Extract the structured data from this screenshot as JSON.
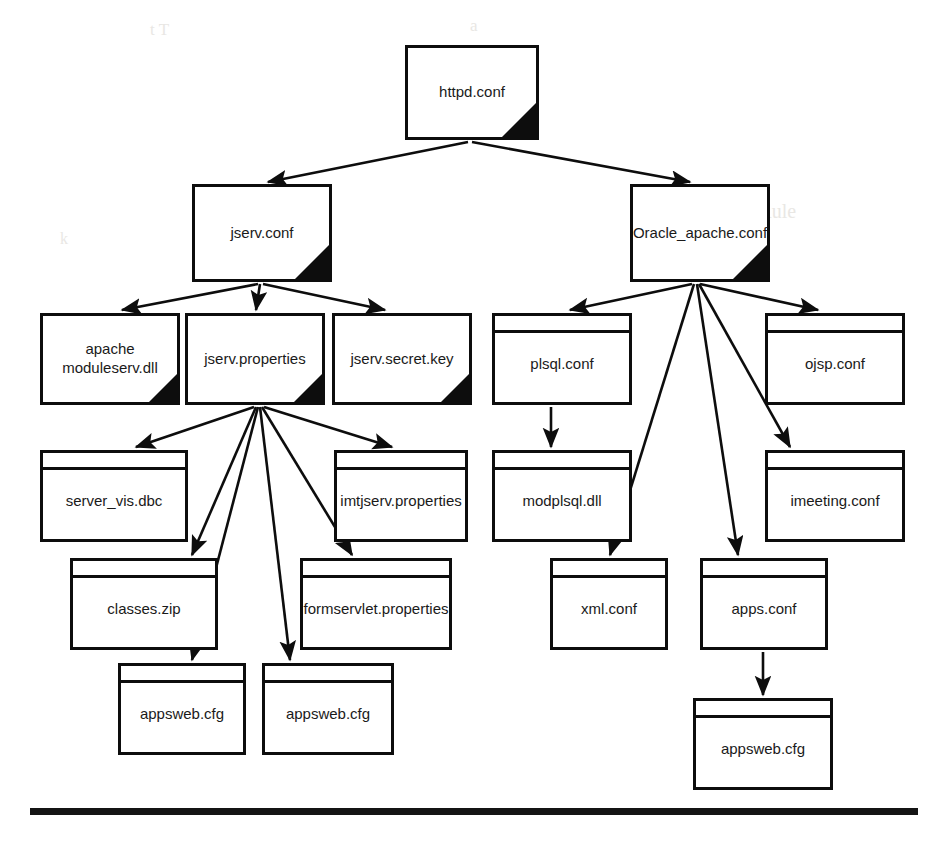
{
  "figure": {
    "type": "tree-diagram",
    "style": {
      "line_color": "#0d0d0d",
      "box_fill": "#ffffff",
      "page_background": "#ffffff"
    }
  },
  "nodes": [
    {
      "id": "httpd",
      "label": "httpd.conf",
      "shape": "dogear",
      "x": 405,
      "y": 45,
      "w": 134,
      "h": 95
    },
    {
      "id": "jserv",
      "label": "jserv.conf",
      "shape": "dogear",
      "x": 192,
      "y": 184,
      "w": 140,
      "h": 98
    },
    {
      "id": "oracle",
      "label": "Oracle_apache.conf",
      "shape": "dogear",
      "x": 630,
      "y": 184,
      "w": 140,
      "h": 98
    },
    {
      "id": "apachemod",
      "label": "apache\nmoduleserv.dll",
      "shape": "dogear",
      "x": 40,
      "y": 313,
      "w": 140,
      "h": 92
    },
    {
      "id": "jservprops",
      "label": "jserv.properties",
      "shape": "dogear",
      "x": 185,
      "y": 313,
      "w": 140,
      "h": 92
    },
    {
      "id": "jservsecret",
      "label": "jserv.secret.key",
      "shape": "dogear",
      "x": 332,
      "y": 313,
      "w": 140,
      "h": 92
    },
    {
      "id": "plsql",
      "label": "plsql.conf",
      "shape": "banded",
      "x": 492,
      "y": 313,
      "w": 140,
      "h": 92
    },
    {
      "id": "ojsp",
      "label": "ojsp.conf",
      "shape": "banded",
      "x": 765,
      "y": 313,
      "w": 140,
      "h": 92
    },
    {
      "id": "servervis",
      "label": "server_vis.dbc",
      "shape": "banded",
      "x": 40,
      "y": 450,
      "w": 148,
      "h": 92
    },
    {
      "id": "imtjserv",
      "label": "imtjserv.properties",
      "shape": "banded",
      "x": 334,
      "y": 450,
      "w": 134,
      "h": 92
    },
    {
      "id": "modplsql",
      "label": "modplsql.dll",
      "shape": "banded",
      "x": 492,
      "y": 450,
      "w": 140,
      "h": 92
    },
    {
      "id": "imeeting",
      "label": "imeeting.conf",
      "shape": "banded",
      "x": 765,
      "y": 450,
      "w": 140,
      "h": 92
    },
    {
      "id": "classeszip",
      "label": "classes.zip",
      "shape": "banded",
      "x": 70,
      "y": 558,
      "w": 148,
      "h": 92
    },
    {
      "id": "formservlet",
      "label": "formservlet.properties",
      "shape": "banded",
      "x": 300,
      "y": 558,
      "w": 152,
      "h": 92
    },
    {
      "id": "xmlconf",
      "label": "xml.conf",
      "shape": "banded",
      "x": 550,
      "y": 558,
      "w": 118,
      "h": 92
    },
    {
      "id": "appsconf",
      "label": "apps.conf",
      "shape": "banded",
      "x": 700,
      "y": 558,
      "w": 128,
      "h": 92
    },
    {
      "id": "appsweb1",
      "label": "appsweb.cfg",
      "shape": "banded",
      "x": 118,
      "y": 663,
      "w": 128,
      "h": 92
    },
    {
      "id": "appsweb2",
      "label": "appsweb.cfg",
      "shape": "banded",
      "x": 262,
      "y": 663,
      "w": 132,
      "h": 92
    },
    {
      "id": "appsweb3",
      "label": "appsweb.cfg",
      "shape": "banded",
      "x": 693,
      "y": 698,
      "w": 140,
      "h": 92
    }
  ],
  "edges": [
    {
      "from": "httpd",
      "to": "jserv",
      "x1": 468,
      "y1": 142,
      "x2": 268,
      "y2": 182
    },
    {
      "from": "httpd",
      "to": "oracle",
      "x1": 472,
      "y1": 142,
      "x2": 690,
      "y2": 182
    },
    {
      "from": "jserv",
      "to": "apachemod",
      "x1": 258,
      "y1": 284,
      "x2": 122,
      "y2": 310
    },
    {
      "from": "jserv",
      "to": "jservprops",
      "x1": 260,
      "y1": 284,
      "x2": 256,
      "y2": 310
    },
    {
      "from": "jserv",
      "to": "jservsecret",
      "x1": 263,
      "y1": 284,
      "x2": 385,
      "y2": 310
    },
    {
      "from": "oracle",
      "to": "plsql",
      "x1": 692,
      "y1": 284,
      "x2": 570,
      "y2": 310
    },
    {
      "from": "oracle",
      "to": "xmlconf",
      "x1": 694,
      "y1": 284,
      "x2": 610,
      "y2": 555
    },
    {
      "from": "oracle",
      "to": "appsconf",
      "x1": 697,
      "y1": 284,
      "x2": 738,
      "y2": 555
    },
    {
      "from": "oracle",
      "to": "imeeting",
      "x1": 699,
      "y1": 284,
      "x2": 790,
      "y2": 447
    },
    {
      "from": "oracle",
      "to": "ojsp",
      "x1": 700,
      "y1": 284,
      "x2": 818,
      "y2": 310
    },
    {
      "from": "jservprops",
      "to": "servervis",
      "x1": 254,
      "y1": 407,
      "x2": 136,
      "y2": 447
    },
    {
      "from": "jservprops",
      "to": "classeszip",
      "x1": 256,
      "y1": 407,
      "x2": 192,
      "y2": 555
    },
    {
      "from": "jservprops",
      "to": "appsweb1",
      "x1": 258,
      "y1": 407,
      "x2": 192,
      "y2": 660
    },
    {
      "from": "jservprops",
      "to": "appsweb2",
      "x1": 260,
      "y1": 407,
      "x2": 290,
      "y2": 660
    },
    {
      "from": "jservprops",
      "to": "formservlet",
      "x1": 262,
      "y1": 407,
      "x2": 352,
      "y2": 555
    },
    {
      "from": "jservprops",
      "to": "imtjserv",
      "x1": 264,
      "y1": 407,
      "x2": 392,
      "y2": 447
    },
    {
      "from": "plsql",
      "to": "modplsql",
      "x1": 551,
      "y1": 407,
      "x2": 551,
      "y2": 447
    },
    {
      "from": "appsconf",
      "to": "appsweb3",
      "x1": 763,
      "y1": 652,
      "x2": 763,
      "y2": 695
    }
  ],
  "footer_rule": {
    "x": 30,
    "y": 808,
    "w": 888,
    "h": 7
  },
  "background_bleed": [
    {
      "text": "t T",
      "x": 150,
      "y": 20,
      "size": 17
    },
    {
      "text": "a",
      "x": 470,
      "y": 16,
      "size": 17
    },
    {
      "text": "General Rule",
      "x": 690,
      "y": 200,
      "size": 20
    },
    {
      "text": "k",
      "x": 60,
      "y": 230,
      "size": 16
    }
  ]
}
